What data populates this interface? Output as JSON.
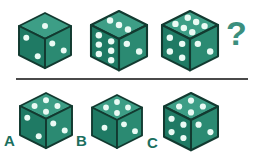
{
  "puzzle": {
    "type": "dice-sequence-visual-reasoning",
    "colors": {
      "die_top_face": "#3d9e86",
      "die_left_face": "#1f7a64",
      "die_right_face": "#2b8a72",
      "die_outline": "#123a30",
      "pip": "#eafaf4",
      "divider": "#4a4a4a",
      "question_mark": "#3b8f7e",
      "option_label": "#1b6f5e",
      "background": "#ffffff"
    },
    "sequence_row": {
      "items": [
        {
          "id": "sequence-die-1",
          "x": 16,
          "y": 10,
          "size": 26,
          "top_pips": 1,
          "left_pips": 2,
          "right_pips": 2
        },
        {
          "id": "sequence-die-2",
          "x": 88,
          "y": 8,
          "size": 28,
          "top_pips": 3,
          "left_pips": 6,
          "right_pips": 2
        },
        {
          "id": "sequence-die-3",
          "x": 159,
          "y": 8,
          "size": 28,
          "top_pips": 6,
          "left_pips": 4,
          "right_pips": 2
        }
      ],
      "unknown": {
        "id": "missing-term",
        "symbol": "?",
        "x": 226,
        "y": 16,
        "font_size": 34
      }
    },
    "divider": {
      "x": 16,
      "y": 78,
      "width": 232,
      "height": 2
    },
    "answer_row": {
      "options": [
        {
          "id": "option-a",
          "label": "A",
          "label_x": 4,
          "label_y": 133,
          "x": 17,
          "y": 90,
          "size": 26,
          "top_pips": 4,
          "left_pips": 2,
          "right_pips": 2
        },
        {
          "id": "option-b",
          "label": "B",
          "label_x": 76,
          "label_y": 133,
          "x": 89,
          "y": 92,
          "size": 25,
          "top_pips": 4,
          "left_pips": 1,
          "right_pips": 2
        },
        {
          "id": "option-c",
          "label": "C",
          "label_x": 147,
          "label_y": 135,
          "x": 161,
          "y": 90,
          "size": 27,
          "top_pips": 4,
          "left_pips": 4,
          "right_pips": 2
        }
      ],
      "label_font_size": 15
    }
  }
}
